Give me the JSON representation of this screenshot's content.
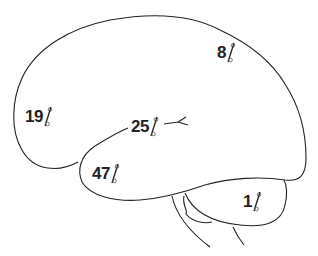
{
  "diagram": {
    "type": "brain-lateral-view",
    "line_color": "#222222",
    "background": "#ffffff",
    "regions": [
      {
        "name": "parietal",
        "value": "8",
        "unit": "%"
      },
      {
        "name": "frontal",
        "value": "19",
        "unit": "%"
      },
      {
        "name": "lateral-sulcus",
        "value": "25",
        "unit": "%"
      },
      {
        "name": "temporal",
        "value": "47",
        "unit": "%"
      },
      {
        "name": "cerebellum",
        "value": "1",
        "unit": "%"
      }
    ]
  }
}
